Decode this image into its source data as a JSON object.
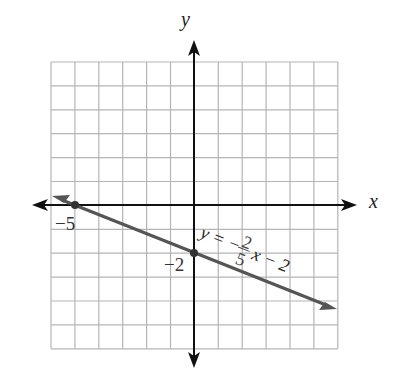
{
  "chart_data": {
    "type": "line",
    "title": "",
    "xlabel": "x",
    "ylabel": "y",
    "xlim": [
      -6,
      6
    ],
    "ylim": [
      -6,
      6
    ],
    "grid": true,
    "series": [
      {
        "name": "y = -2/5 x - 2",
        "slope": -0.4,
        "intercept": -2,
        "x": [
          -6,
          -5,
          0,
          6
        ],
        "y": [
          0.4,
          0,
          -2,
          -4.4
        ]
      }
    ],
    "points": [
      {
        "label": "-5",
        "x": -5,
        "y": 0
      },
      {
        "label": "-2",
        "x": 0,
        "y": -2
      }
    ],
    "annotations": [
      "y = -2/5 x - 2",
      "-5",
      "-2"
    ]
  },
  "labels": {
    "x_axis": "x",
    "y_axis": "y",
    "x_intercept": "−5",
    "y_intercept": "−2",
    "eq_lhs": "y = −",
    "eq_num": "2",
    "eq_den": "5",
    "eq_rhs": "x − 2"
  }
}
